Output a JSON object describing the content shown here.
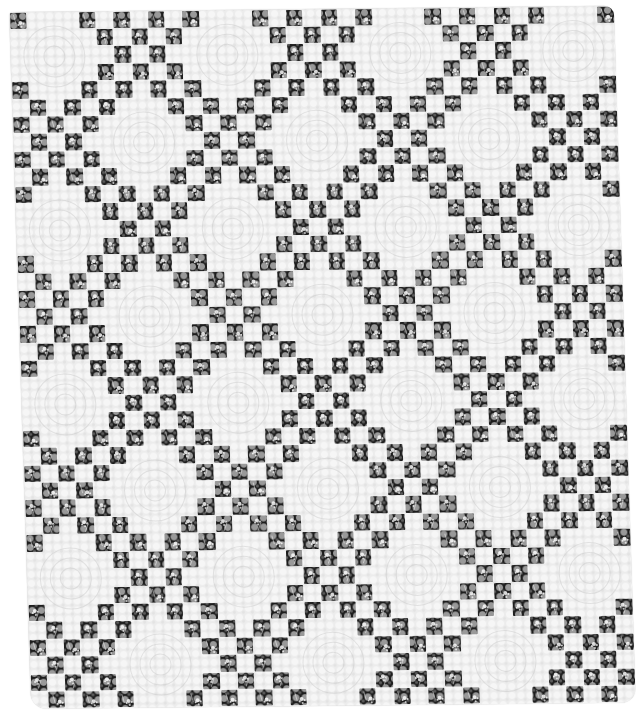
{
  "image": {
    "subject": "Irish chain quilt",
    "description": "Black-and-white photograph of a single Irish chain quilt: a lattice of dark floral-print squares alternating with white plain blocks that have dark corner squares and feather/medallion quilting.",
    "colors": {
      "background": "#ffffff",
      "light_fabric": "#ececec",
      "dark_fabric": "#1d1d1d",
      "print_motif": "#d8d8d8"
    }
  },
  "quilt": {
    "rows": 40,
    "cols": 35,
    "block_size": 5,
    "cell_px": 17.3,
    "pattern": {
      "checker_block": "blocks where (blockRow + blockCol) is odd: dark squares where (row + col) is even",
      "plain_block": "blocks where (blockRow + blockCol) is even: dark squares only at the 4 corners"
    },
    "block_rows": 8,
    "block_cols": 7
  }
}
